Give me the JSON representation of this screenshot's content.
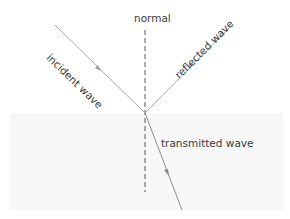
{
  "diagram": {
    "labels": {
      "normal": "normal",
      "incident": "incident wave",
      "reflected": "reflected wave",
      "transmitted": "transmitted wave"
    },
    "colors": {
      "ray": "#a8a8a8",
      "normal_line": "#555555",
      "text": "#3a3a3a",
      "lower_medium": "#f7f7f7",
      "background": "#ffffff"
    }
  }
}
